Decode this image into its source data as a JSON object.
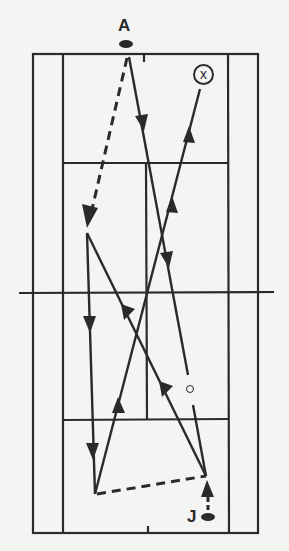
{
  "diagram": {
    "type": "tennis-drill",
    "colors": {
      "ink": "#2a2a2a",
      "paper": "#f4f4f2"
    },
    "court": {
      "outer": {
        "x1": 33,
        "y1": 54,
        "x2": 258,
        "y2": 533
      },
      "singles_left_x": 63,
      "singles_right_x": 228,
      "top_service_y": 163,
      "bottom_service_y": 420,
      "center_x": 147,
      "net": {
        "x1": 19,
        "x2": 274,
        "y": 293
      },
      "top_center_mark": {
        "x": 144,
        "y1": 54,
        "y2": 60
      },
      "bottom_center_mark": {
        "x": 148,
        "y1": 527,
        "y2": 533
      }
    },
    "players": [
      {
        "id": "A",
        "label": "A",
        "label_x": 118,
        "label_y": 18,
        "dot_x": 119,
        "dot_y": 40
      },
      {
        "id": "J",
        "label": "J",
        "label_x": 187,
        "label_y": 506,
        "dot_x": 201,
        "dot_y": 512
      }
    ],
    "target": {
      "symbol": "⊗",
      "glyph": "x",
      "cx": 203,
      "cy": 74
    },
    "ball_marker": {
      "cx": 190,
      "cy": 389
    }
  },
  "legend_labels": {
    "player_a": "A",
    "player_j": "J",
    "target": "X"
  }
}
